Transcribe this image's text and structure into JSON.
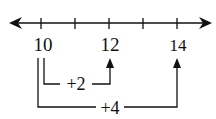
{
  "diagram": {
    "type": "number-line",
    "tick_labels": [
      {
        "value": "10",
        "x": 43
      },
      {
        "value": "12",
        "x": 110
      },
      {
        "value": "14",
        "x": 178
      }
    ],
    "ticks_x": [
      41,
      75,
      109,
      143,
      177
    ],
    "jumps": [
      {
        "label": "+2",
        "from": "10",
        "to": "12"
      },
      {
        "label": "+4",
        "from": "10",
        "to": "14"
      }
    ],
    "colors": {
      "stroke": "#111111",
      "background": "#ffffff"
    }
  }
}
